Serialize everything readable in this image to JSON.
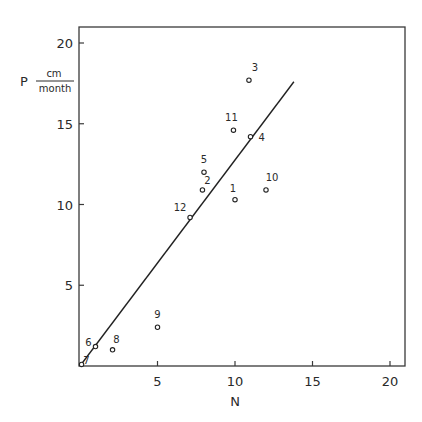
{
  "chart_data": {
    "type": "scatter",
    "title": "",
    "xlabel": "N",
    "ylabel": "P",
    "ylabel_unit_numerator": "cm",
    "ylabel_unit_denominator": "month",
    "xlim": [
      0,
      20.8
    ],
    "ylim": [
      0,
      21
    ],
    "xticks": [
      5,
      10,
      15,
      20
    ],
    "yticks": [
      5,
      10,
      15,
      20
    ],
    "grid": false,
    "legend": null,
    "points": [
      {
        "label": "1",
        "x": 10.0,
        "y": 10.3
      },
      {
        "label": "2",
        "x": 7.9,
        "y": 10.9
      },
      {
        "label": "3",
        "x": 10.9,
        "y": 17.7
      },
      {
        "label": "4",
        "x": 11.0,
        "y": 14.2
      },
      {
        "label": "5",
        "x": 8.0,
        "y": 12.0
      },
      {
        "label": "6",
        "x": 1.0,
        "y": 1.2
      },
      {
        "label": "7",
        "x": 0.1,
        "y": 0.1
      },
      {
        "label": "8",
        "x": 2.1,
        "y": 1.0
      },
      {
        "label": "9",
        "x": 5.0,
        "y": 2.4
      },
      {
        "label": "10",
        "x": 12.0,
        "y": 10.9
      },
      {
        "label": "11",
        "x": 9.9,
        "y": 14.6
      },
      {
        "label": "12",
        "x": 7.1,
        "y": 9.2
      }
    ],
    "fit_line": {
      "x": [
        0,
        13.8
      ],
      "y": [
        0,
        17.6
      ]
    }
  }
}
